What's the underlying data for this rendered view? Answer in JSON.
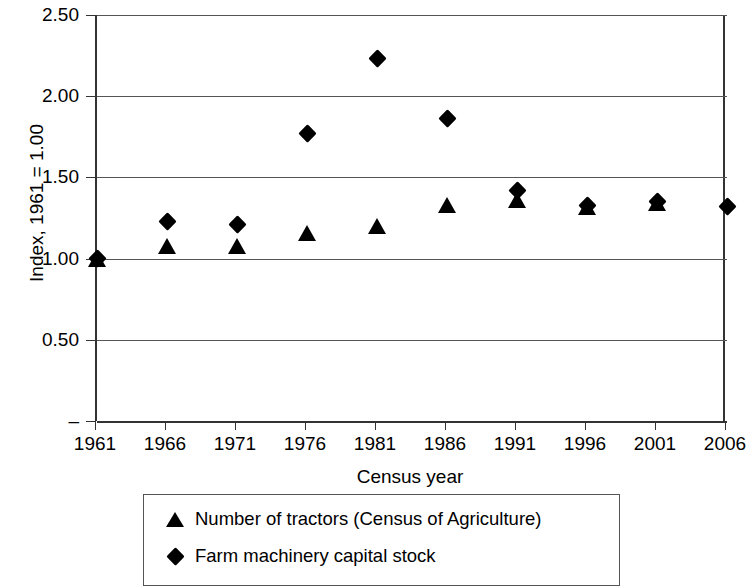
{
  "chart_data": {
    "type": "scatter",
    "title": "",
    "xlabel": "Census year",
    "ylabel": "Index, 1961 = 1.00",
    "categories": [
      "1961",
      "1966",
      "1971",
      "1976",
      "1981",
      "1986",
      "1991",
      "1996",
      "2001",
      "2006"
    ],
    "x": [
      1961,
      1966,
      1971,
      1976,
      1981,
      1986,
      1991,
      1996,
      2001,
      2006
    ],
    "ylim": [
      0,
      2.5
    ],
    "xlim": [
      1961,
      2006
    ],
    "y_tick_labels": [
      "2.50",
      "2.00",
      "1.50",
      "1.00",
      "0.50",
      "–"
    ],
    "y_tick_values": [
      2.5,
      2.0,
      1.5,
      1.0,
      0.5,
      0
    ],
    "grid": true,
    "legend_position": "bottom",
    "series": [
      {
        "name": "Number of tractors (Census of Agriculture)",
        "marker": "triangle",
        "color": "#000000",
        "values": [
          1.0,
          1.08,
          1.08,
          1.16,
          1.2,
          1.33,
          1.36,
          1.32,
          1.34,
          null
        ]
      },
      {
        "name": "Farm machinery capital stock",
        "marker": "diamond",
        "color": "#000000",
        "values": [
          1.0,
          1.23,
          1.21,
          1.77,
          2.23,
          1.86,
          1.42,
          1.33,
          1.35,
          1.32
        ]
      }
    ]
  },
  "legend": {
    "items": [
      {
        "marker": "triangle-icon",
        "label": "Number of tractors (Census of Agriculture)"
      },
      {
        "marker": "diamond-icon",
        "label": "Farm machinery capital stock"
      }
    ]
  },
  "colors": {
    "marker": "#000000",
    "gridline": "#555555",
    "axis": "#333333",
    "background": "#ffffff"
  }
}
